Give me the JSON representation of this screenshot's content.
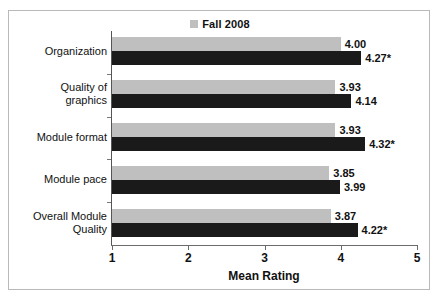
{
  "chart_data": {
    "type": "bar",
    "orientation": "horizontal",
    "title": "",
    "xlabel": "Mean Rating",
    "ylabel": "",
    "xlim": [
      1,
      5
    ],
    "xticks": [
      1,
      2,
      3,
      4,
      5
    ],
    "xtick_labels": [
      "1",
      "2",
      "3",
      "4",
      "5"
    ],
    "grid": false,
    "legend_position": "top-center",
    "categories": [
      "Organization",
      "Quality of graphics",
      "Module format",
      "Module pace",
      "Overall Module Quality"
    ],
    "category_label_lines": [
      [
        "Organization"
      ],
      [
        "Quality of",
        "graphics"
      ],
      [
        "Module format"
      ],
      [
        "Module pace"
      ],
      [
        "Overall Module",
        "Quality"
      ]
    ],
    "series": [
      {
        "name": "Fall 2008",
        "color": "#bfbfbf",
        "values": [
          4.0,
          3.93,
          3.93,
          3.85,
          3.87
        ],
        "labels": [
          "4.00",
          "3.93",
          "3.93",
          "3.85",
          "3.87"
        ]
      },
      {
        "name": "",
        "color": "#1a1a1a",
        "values": [
          4.27,
          4.14,
          4.32,
          3.99,
          4.22
        ],
        "labels": [
          "4.27*",
          "4.14",
          "4.32*",
          "3.99",
          "4.22*"
        ]
      }
    ],
    "legend_entries": [
      {
        "label": "Fall 2008",
        "color": "#bfbfbf"
      }
    ],
    "annotation_note": "* denotes significance marker appended to black series labels"
  },
  "legend": {
    "entry_label": "Fall 2008",
    "swatch_color": "#bfbfbf"
  },
  "axis": {
    "x_title": "Mean Rating"
  },
  "colors": {
    "series_gray": "#bfbfbf",
    "series_black": "#1a1a1a",
    "axis": "#6b6b6b",
    "border": "#b9b9b9",
    "text": "#111111"
  }
}
